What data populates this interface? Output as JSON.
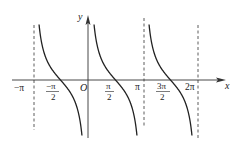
{
  "chart_data": {
    "type": "line",
    "title": "",
    "function": "y = cot x",
    "xlabel": "x",
    "ylabel": "y",
    "origin_label": "O",
    "x_tick_labels": [
      {
        "label": "−π",
        "value": -3.1416
      },
      {
        "label": "−π/2",
        "num": "−π",
        "den": "2",
        "value": -1.5708
      },
      {
        "label": "π/2",
        "num": "π",
        "den": "2",
        "value": 1.5708
      },
      {
        "label": "π",
        "value": 3.1416
      },
      {
        "label": "3π/2",
        "num": "3π",
        "den": "2",
        "value": 4.7124
      },
      {
        "label": "2π",
        "value": 6.2832
      }
    ],
    "asymptotes": [
      -3.1416,
      3.1416,
      6.2832
    ],
    "asymptote_style": "dashed",
    "branches": [
      {
        "x_range": [
          -3.1416,
          0
        ],
        "zero_at": -1.5708
      },
      {
        "x_range": [
          0,
          3.1416
        ],
        "zero_at": 1.5708
      },
      {
        "x_range": [
          3.1416,
          6.2832
        ],
        "zero_at": 4.7124
      }
    ],
    "grid": false,
    "legend": null
  }
}
